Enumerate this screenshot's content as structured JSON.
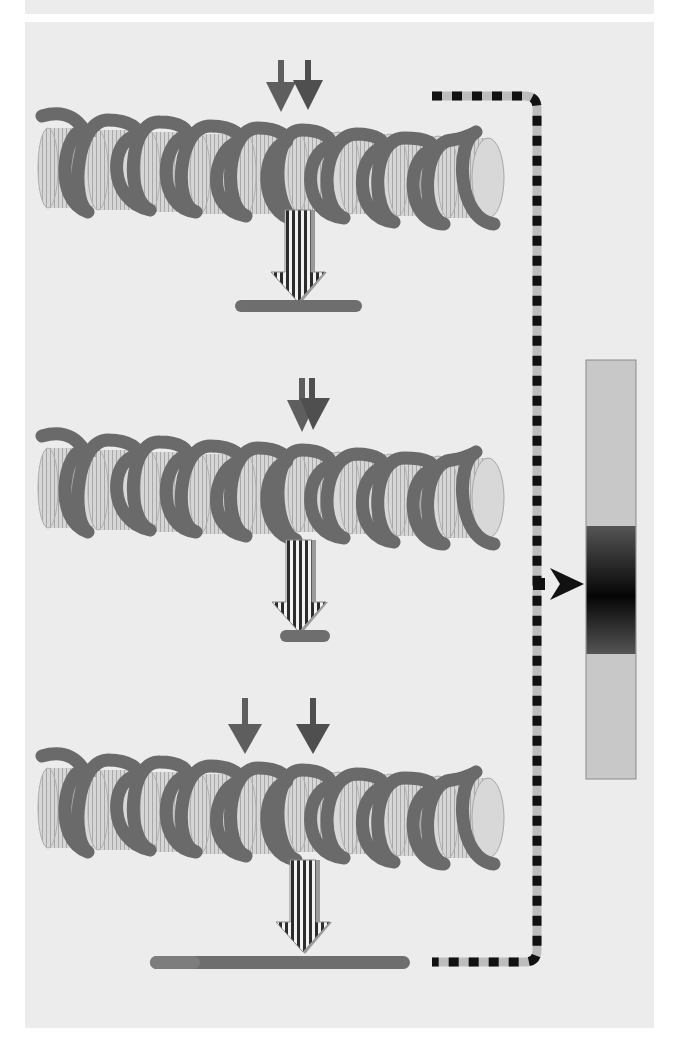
{
  "figure": {
    "type": "nucleosome-array-cleavage-diagram",
    "colors": {
      "background": "#ececec",
      "dna_strand": "#6a6a6a",
      "histone_core": "#d4d4d4",
      "histone_rim": "#b8b8b8",
      "cleavage_arrow": "#5e5e5e",
      "product_bar": "#6e6e6e",
      "dashed_line_dark": "#111111",
      "dashed_line_light": "#bdbdbd",
      "gel_lane": "#c8c8c8",
      "gel_band": "#111111"
    },
    "arrays": [
      {
        "id": "array-1",
        "cleavage_arrows": [
          {
            "x": 281,
            "y_top": 60,
            "y_tip": 110
          },
          {
            "x": 308,
            "y_top": 60,
            "y_tip": 108
          }
        ],
        "center_y": 160,
        "product": {
          "x1": 235,
          "x2": 362,
          "y": 306
        }
      },
      {
        "id": "array-2",
        "cleavage_arrows": [
          {
            "x": 302,
            "y_top": 378,
            "y_tip": 432
          },
          {
            "x": 311,
            "y_top": 378,
            "y_tip": 430
          }
        ],
        "center_y": 480,
        "product": {
          "x1": 280,
          "x2": 330,
          "y": 636
        }
      },
      {
        "id": "array-3",
        "cleavage_arrows": [
          {
            "x": 245,
            "y_top": 698,
            "y_tip": 752
          },
          {
            "x": 313,
            "y_top": 698,
            "y_tip": 752
          }
        ],
        "center_y": 800,
        "product": {
          "x1": 150,
          "x2": 410,
          "y": 962
        }
      }
    ],
    "gel": {
      "lane": {
        "x": 586,
        "y": 360,
        "width": 50,
        "height": 419
      },
      "band": {
        "y": 526,
        "height": 128
      },
      "pointer_y": 584
    }
  }
}
